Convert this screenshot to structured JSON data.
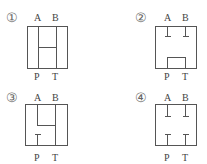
{
  "diagrams": [
    {
      "number": "①",
      "top_labels": [
        "A",
        "B"
      ],
      "bottom_labels": [
        "P",
        "T"
      ],
      "description": "H-type center: all ports connected (A, B, P, T)"
    },
    {
      "number": "②",
      "top_labels": [
        "A",
        "B"
      ],
      "bottom_labels": [
        "P",
        "T"
      ],
      "description": "A and B blocked; P connected to T (tandem)"
    },
    {
      "number": "③",
      "top_labels": [
        "A",
        "B"
      ],
      "bottom_labels": [
        "P",
        "T"
      ],
      "description": "A, B, T connected; P blocked"
    },
    {
      "number": "④",
      "top_labels": [
        "A",
        "B"
      ],
      "bottom_labels": [
        "P",
        "T"
      ],
      "description": "All ports blocked (closed center)"
    }
  ]
}
